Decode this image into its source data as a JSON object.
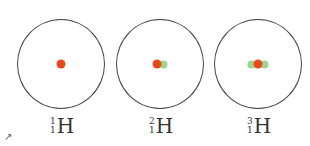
{
  "diagram": {
    "colors": {
      "proton": "#e8491d",
      "neutron": "#9fd38f",
      "orbit": "#444444"
    },
    "isotopes": [
      {
        "mass_number": "1",
        "atomic_number": "1",
        "symbol": "H",
        "protons": 1,
        "neutrons": 0
      },
      {
        "mass_number": "2",
        "atomic_number": "1",
        "symbol": "H",
        "protons": 1,
        "neutrons": 1
      },
      {
        "mass_number": "3",
        "atomic_number": "1",
        "symbol": "H",
        "protons": 1,
        "neutrons": 2
      }
    ],
    "corner_mark": "↗"
  }
}
